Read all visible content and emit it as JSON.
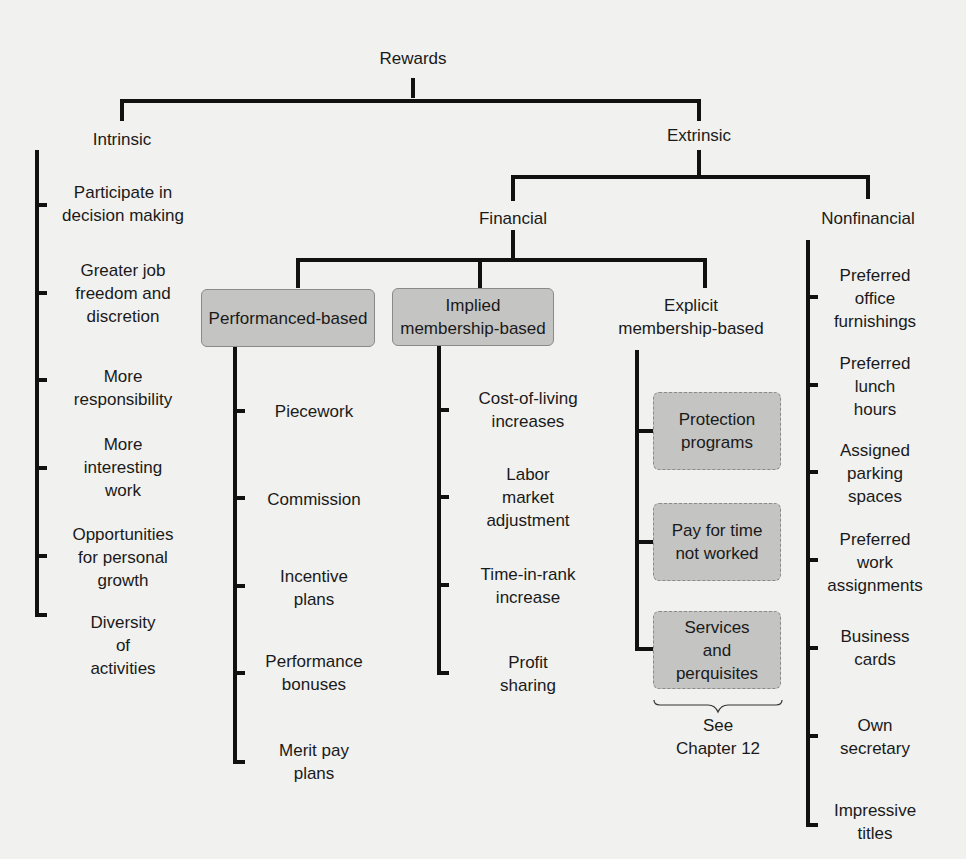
{
  "root": "Rewards",
  "intrinsic": {
    "label": "Intrinsic",
    "items": [
      "Participate in\ndecision making",
      "Greater job\nfreedom and\ndiscretion",
      "More\nresponsibility",
      "More\ninteresting\nwork",
      "Opportunities\nfor personal\ngrowth",
      "Diversity\nof\nactivities"
    ]
  },
  "extrinsic": {
    "label": "Extrinsic",
    "financial": {
      "label": "Financial",
      "performance": {
        "label": "Performanced-based",
        "items": [
          "Piecework",
          "Commission",
          "Incentive\nplans",
          "Performance\nbonuses",
          "Merit pay\nplans"
        ]
      },
      "implied": {
        "label": "Implied\nmembership-based",
        "items": [
          "Cost-of-living\nincreases",
          "Labor\nmarket\nadjustment",
          "Time-in-rank\nincrease",
          "Profit\nsharing"
        ]
      },
      "explicit": {
        "label": "Explicit\nmembership-based",
        "items": [
          "Protection\nprograms",
          "Pay for time\nnot worked",
          "Services\nand\nperquisites"
        ],
        "note": "See\nChapter 12"
      }
    },
    "nonfinancial": {
      "label": "Nonfinancial",
      "items": [
        "Preferred\noffice\nfurnishings",
        "Preferred\nlunch\nhours",
        "Assigned\nparking\nspaces",
        "Preferred\nwork\nassignments",
        "Business\ncards",
        "Own\nsecretary",
        "Impressive\ntitles"
      ]
    }
  }
}
